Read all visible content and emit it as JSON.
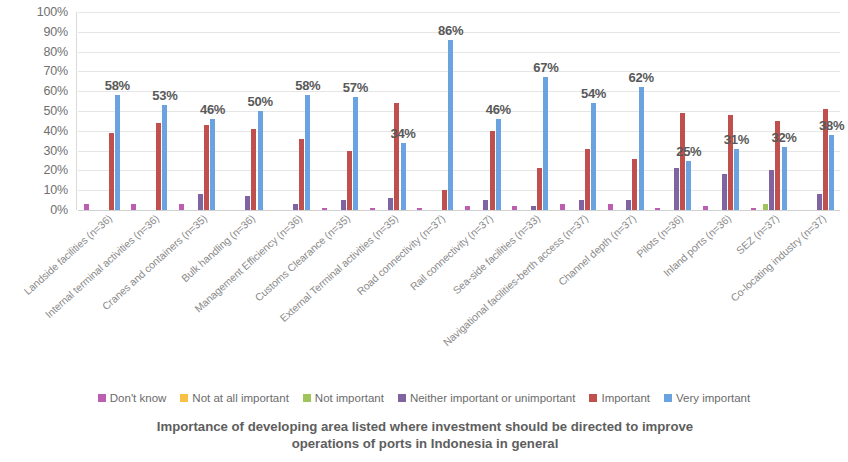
{
  "chart_data": {
    "type": "bar",
    "title": "",
    "xlabel": "Importance of developing area listed where investment should be directed to improve operations of ports in Indonesia in general",
    "ylabel": "",
    "ylim": [
      0,
      100
    ],
    "ytick_labels": [
      "100%",
      "90%",
      "80%",
      "70%",
      "60%",
      "50%",
      "40%",
      "30%",
      "20%",
      "10%",
      "0%"
    ],
    "ytick_values": [
      100,
      90,
      80,
      70,
      60,
      50,
      40,
      30,
      20,
      10,
      0
    ],
    "grid": true,
    "legend_position": "bottom",
    "value_labels_series": "Very important",
    "categories": [
      "Landside facilities (n=36)",
      "Internal terminal activities (n=36)",
      "Cranes and containers (n=35)",
      "Bulk handling (n=36)",
      "Management Efficiency (n=36)",
      "Customs Clearance (n=35)",
      "External Terminal activities (n=35)",
      "Road connectivity (n=37)",
      "Rail connectivity (n=37)",
      "Sea-side facilities (n=33)",
      "Navigational facilities-berth access (n=37)",
      "Channel depth (n=37)",
      "Pilots (n=36)",
      "Inland ports (n=36)",
      "SEZ (n=37)",
      "Co-locating industry (n=37)"
    ],
    "series": [
      {
        "name": "Don't know",
        "color": "#BC5FB0",
        "values": [
          3,
          3,
          3,
          0,
          0,
          1,
          1,
          1,
          2,
          2,
          3,
          3,
          1,
          2,
          1,
          0
        ]
      },
      {
        "name": "Not at all important",
        "color": "#F7C143",
        "values": [
          0,
          0,
          0,
          0,
          0,
          0,
          0,
          0,
          0,
          0,
          0,
          0,
          0,
          0,
          0,
          0
        ]
      },
      {
        "name": "Not important",
        "color": "#9FC45A",
        "values": [
          0,
          0,
          0,
          0,
          0,
          0,
          0,
          0,
          0,
          0,
          0,
          0,
          0,
          0,
          3,
          0
        ]
      },
      {
        "name": "Neither important or unimportant",
        "color": "#8064A2",
        "values": [
          0,
          0,
          8,
          7,
          3,
          5,
          6,
          0,
          5,
          2,
          5,
          5,
          21,
          18,
          20,
          8
        ]
      },
      {
        "name": "Important",
        "color": "#C0504D",
        "values": [
          39,
          44,
          43,
          41,
          36,
          30,
          54,
          10,
          40,
          21,
          31,
          26,
          49,
          48,
          45,
          51
        ]
      },
      {
        "name": "Very important",
        "color": "#6BA3E0",
        "values": [
          58,
          53,
          46,
          50,
          58,
          57,
          34,
          86,
          46,
          67,
          54,
          62,
          25,
          31,
          32,
          38
        ]
      }
    ],
    "data_labels": [
      "58%",
      "53%",
      "46%",
      "50%",
      "58%",
      "57%",
      "34%",
      "86%",
      "46%",
      "67%",
      "54%",
      "62%",
      "25%",
      "31%",
      "32%",
      "38%"
    ]
  },
  "axis_title": {
    "line1": "Importance of developing area listed where investment should be directed to improve",
    "line2": "operations of ports in Indonesia in general"
  }
}
